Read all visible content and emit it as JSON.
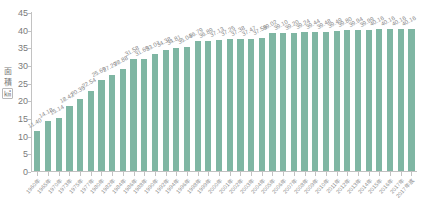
{
  "chart_data": {
    "type": "bar",
    "title": "",
    "xlabel": "",
    "ylabel": "面積 (㎢)",
    "ylabel_parts": [
      "面",
      "積",
      "㎢"
    ],
    "ylim": [
      0,
      45
    ],
    "yticks": [
      45,
      40,
      35,
      30,
      25,
      20,
      15,
      10,
      5,
      0
    ],
    "grid": false,
    "legend": "none",
    "bar_color": "#7fb6a3",
    "axis_color": "#c2c2c2",
    "text_color": "#8a8a8a",
    "categories": [
      "1960年",
      "1965年",
      "1970年",
      "1973年",
      "1975年",
      "1977年",
      "1980年",
      "1982年",
      "1984年",
      "1986年",
      "1988年",
      "1990年",
      "1992年",
      "1994年",
      "1996年",
      "1998年",
      "1999年",
      "2000年",
      "2001年",
      "2002年",
      "2003年",
      "2004年",
      "2005年",
      "2006年",
      "2007年",
      "2008年",
      "2009年",
      "2010年",
      "2011年",
      "2012年",
      "2013年",
      "2014年",
      "2015年",
      "2016年",
      "2017年",
      "2017年底"
    ],
    "values": [
      11.4,
      14.18,
      15.14,
      18.42,
      20.35,
      22.54,
      25.69,
      27.29,
      28.88,
      31.58,
      31.69,
      33.07,
      34.38,
      34.81,
      35.04,
      36.79,
      36.89,
      37.13,
      37.25,
      37.38,
      37.47,
      37.56,
      39.02,
      39.1,
      39.2,
      39.24,
      39.44,
      39.48,
      39.49,
      39.8,
      39.94,
      39.99,
      40.16,
      40.16,
      40.16,
      40.16
    ],
    "value_labels": [
      "11.40",
      "14.18",
      "15.14",
      "18.42",
      "20.35",
      "22.54",
      "25.69",
      "27.29",
      "28.88",
      "31.58",
      "31.69",
      "33.07",
      "34.38",
      "34.81",
      "35.04",
      "36.79",
      "36.89",
      "37.13",
      "37.25",
      "37.38",
      "37.47",
      "37.56",
      "39.02",
      "39.10",
      "39.20",
      "39.24",
      "39.44",
      "39.48",
      "39.49",
      "39.80",
      "39.94",
      "39.99",
      "40.16",
      "40.16",
      "40.16",
      "40.16"
    ]
  }
}
